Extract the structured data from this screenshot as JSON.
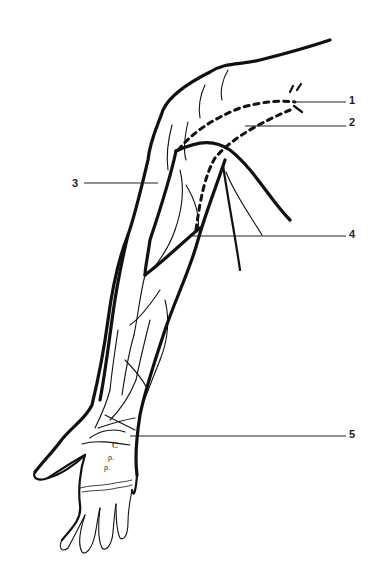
{
  "figure": {
    "line_color": "#111111",
    "background": "#ffffff"
  },
  "callouts": [
    {
      "number": "1",
      "x": 349,
      "y": 95
    },
    {
      "number": "2",
      "x": 349,
      "y": 117
    },
    {
      "number": "3",
      "x": 66,
      "y": 178
    },
    {
      "number": "4",
      "x": 349,
      "y": 229
    },
    {
      "number": "5",
      "x": 349,
      "y": 429
    }
  ]
}
